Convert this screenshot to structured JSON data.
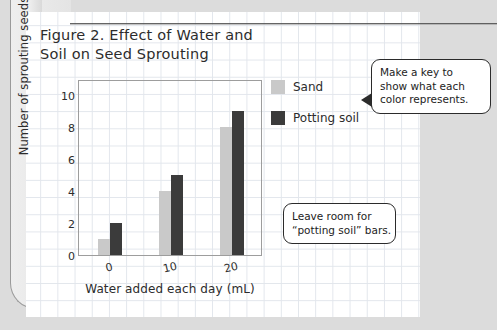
{
  "figure": {
    "title_line1": "Figure 2. Effect of Water and",
    "title_line2": "Soil on Seed Sprouting"
  },
  "legend": {
    "items": [
      {
        "label": "Sand",
        "color": "#c9c9c9"
      },
      {
        "label": "Potting soil",
        "color": "#3b3b3b"
      }
    ]
  },
  "callouts": [
    {
      "id": "key",
      "lines": [
        "Make a key to",
        "show what each",
        "color represents."
      ]
    },
    {
      "id": "room",
      "lines": [
        "Leave room for",
        "“potting soil” bars."
      ]
    }
  ],
  "chart_data": {
    "type": "bar",
    "title": "Figure 2. Effect of Water and Soil on Seed Sprouting",
    "xlabel": "Water added each day (mL)",
    "ylabel": "Number of sprouting seeds",
    "categories": [
      "0",
      "10",
      "20"
    ],
    "series": [
      {
        "name": "Sand",
        "color": "#c9c9c9",
        "values": [
          1,
          4,
          8
        ]
      },
      {
        "name": "Potting soil",
        "color": "#3b3b3b",
        "values": [
          2,
          5,
          9
        ]
      }
    ],
    "yticks": [
      0,
      2,
      4,
      6,
      8,
      10
    ],
    "ylim": [
      0,
      11
    ],
    "grid": false,
    "legend_position": "right"
  }
}
